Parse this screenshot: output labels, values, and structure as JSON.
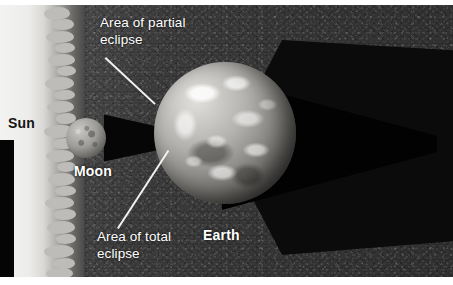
{
  "labels": {
    "sun": "Sun",
    "moon": "Moon",
    "earth": "Earth",
    "partial_eclipse": "Area of partial\neclipse",
    "total_eclipse": "Area of total\neclipse"
  },
  "colors": {
    "space_background": "#3a3a3a",
    "sun_light": "#f3f3f1",
    "sun_flame": "#bdbcb9",
    "umbra": "#020202",
    "penumbra": "#0b0b0b",
    "label_text": "#ffffff",
    "sun_label_text": "#141414",
    "leader_line": "#f2f2f2"
  }
}
